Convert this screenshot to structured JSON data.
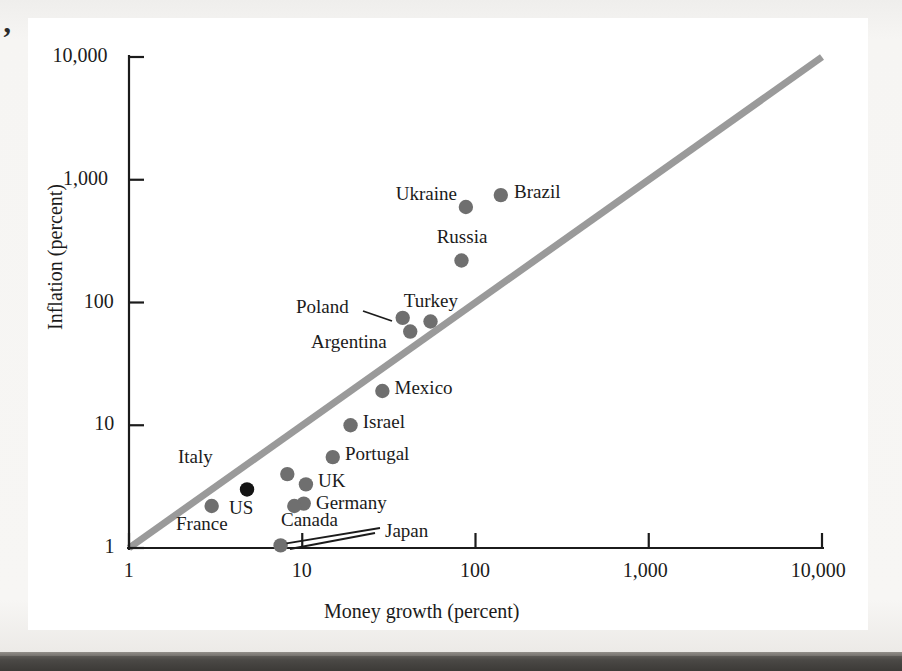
{
  "figure": {
    "quote_mark": "’",
    "background_color": "#f4f3f1",
    "card_color": "#ffffff",
    "point_color": "#6f6f6f",
    "highlight_point_color": "#141414",
    "reference_line_color": "#9a9a9a",
    "axis_color": "#1b1b1b"
  },
  "chart_data": {
    "type": "scatter",
    "title": "",
    "xlabel": "Money growth (percent)",
    "ylabel": "Inflation (percent)",
    "xscale": "log",
    "yscale": "log",
    "xlim": [
      1,
      10000
    ],
    "ylim": [
      1,
      10000
    ],
    "grid": false,
    "legend": "none",
    "xticks": [
      1,
      10,
      100,
      1000,
      10000
    ],
    "xticklabels": [
      "1",
      "10",
      "100",
      "1,000",
      "10,000"
    ],
    "yticks": [
      1,
      10,
      100,
      1000,
      10000
    ],
    "yticklabels": [
      "1",
      "10",
      "100",
      "1,000",
      "10,000"
    ],
    "annotations": [
      {
        "text": "45-degree reference line",
        "from": [
          1,
          1
        ],
        "to": [
          10000,
          10000
        ]
      }
    ],
    "points": [
      {
        "name": "Brazil",
        "x": 140,
        "y": 750,
        "label_pos": "right",
        "highlight": false
      },
      {
        "name": "Ukraine",
        "x": 88,
        "y": 600,
        "label_pos": "left",
        "highlight": false
      },
      {
        "name": "Russia",
        "x": 83,
        "y": 220,
        "label_pos": "above",
        "highlight": false
      },
      {
        "name": "Turkey",
        "x": 55,
        "y": 70,
        "label_pos": "above",
        "highlight": false
      },
      {
        "name": "Poland",
        "x": 38,
        "y": 75,
        "label_pos": "leader",
        "highlight": false
      },
      {
        "name": "Argentina",
        "x": 42,
        "y": 58,
        "label_pos": "left",
        "highlight": false
      },
      {
        "name": "Mexico",
        "x": 29,
        "y": 19,
        "label_pos": "right",
        "highlight": false
      },
      {
        "name": "Israel",
        "x": 19,
        "y": 10,
        "label_pos": "right",
        "highlight": false
      },
      {
        "name": "Portugal",
        "x": 15,
        "y": 5.5,
        "label_pos": "right",
        "highlight": false
      },
      {
        "name": "Italy",
        "x": 8.2,
        "y": 4.0,
        "label_pos": "left",
        "highlight": false
      },
      {
        "name": "UK",
        "x": 10.5,
        "y": 3.3,
        "label_pos": "right",
        "highlight": false
      },
      {
        "name": "US",
        "x": 4.8,
        "y": 3.0,
        "label_pos": "below",
        "highlight": true
      },
      {
        "name": "Germany",
        "x": 10.2,
        "y": 2.3,
        "label_pos": "right",
        "highlight": false
      },
      {
        "name": "Canada",
        "x": 9.0,
        "y": 2.2,
        "label_pos": "above",
        "highlight": false
      },
      {
        "name": "France",
        "x": 3.0,
        "y": 2.2,
        "label_pos": "below",
        "highlight": false
      },
      {
        "name": "Japan",
        "x": 7.5,
        "y": 1.05,
        "label_pos": "leader",
        "highlight": false
      }
    ]
  }
}
